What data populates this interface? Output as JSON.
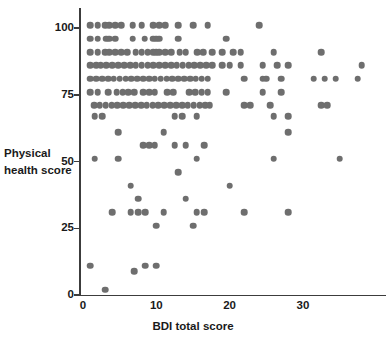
{
  "chart_data": {
    "type": "scatter",
    "title": "",
    "xlabel": "BDI total score",
    "ylabel": "Physical health score",
    "xlim": [
      0,
      42
    ],
    "ylim": [
      0,
      105
    ],
    "grid": false,
    "legend": null,
    "marker_color": "#6e6e6e",
    "axis_color": "#3c3c3c",
    "xticks": [
      {
        "value": 0,
        "label": "0"
      },
      {
        "value": 10,
        "label": "10"
      },
      {
        "value": 20,
        "label": "20"
      },
      {
        "value": 30,
        "label": "30"
      }
    ],
    "yticks": [
      {
        "value": 0,
        "label": "0"
      },
      {
        "value": 25,
        "label": "25"
      },
      {
        "value": 50,
        "label": "50"
      },
      {
        "value": 75,
        "label": "75"
      },
      {
        "value": 100,
        "label": "100"
      }
    ],
    "points": [
      [
        1,
        101
      ],
      [
        2,
        101
      ],
      [
        3,
        101
      ],
      [
        3.6,
        101
      ],
      [
        4.4,
        101
      ],
      [
        5.2,
        101
      ],
      [
        6.8,
        101
      ],
      [
        8,
        101
      ],
      [
        9.6,
        101
      ],
      [
        10.4,
        101
      ],
      [
        11.2,
        101
      ],
      [
        13,
        101
      ],
      [
        15,
        101
      ],
      [
        17,
        101
      ],
      [
        24,
        101
      ],
      [
        1,
        96
      ],
      [
        2,
        96
      ],
      [
        3.2,
        96
      ],
      [
        3.6,
        96
      ],
      [
        4.4,
        96
      ],
      [
        6.8,
        96
      ],
      [
        8.4,
        96
      ],
      [
        9.6,
        96
      ],
      [
        10,
        96
      ],
      [
        10.4,
        96
      ],
      [
        13,
        96
      ],
      [
        19.5,
        96
      ],
      [
        1,
        91
      ],
      [
        2,
        91
      ],
      [
        3,
        91
      ],
      [
        3.6,
        91
      ],
      [
        4.4,
        91
      ],
      [
        5.2,
        91
      ],
      [
        6,
        91
      ],
      [
        7.2,
        91
      ],
      [
        8,
        91
      ],
      [
        8.8,
        91
      ],
      [
        9.6,
        91
      ],
      [
        10,
        91
      ],
      [
        10.4,
        91
      ],
      [
        11.2,
        91
      ],
      [
        12,
        91
      ],
      [
        13.2,
        91
      ],
      [
        14,
        91
      ],
      [
        15.6,
        91
      ],
      [
        16.4,
        91
      ],
      [
        17.6,
        91
      ],
      [
        19,
        91
      ],
      [
        20.5,
        91
      ],
      [
        21.5,
        91
      ],
      [
        26,
        91
      ],
      [
        32.5,
        91
      ],
      [
        1,
        86
      ],
      [
        1.8,
        86
      ],
      [
        2.4,
        86
      ],
      [
        3.2,
        86
      ],
      [
        4,
        86
      ],
      [
        4.8,
        86
      ],
      [
        5.6,
        86
      ],
      [
        6.4,
        86
      ],
      [
        7.2,
        86
      ],
      [
        8,
        86
      ],
      [
        8.8,
        86
      ],
      [
        9.6,
        86
      ],
      [
        10.4,
        86
      ],
      [
        11.2,
        86
      ],
      [
        12,
        86
      ],
      [
        12.8,
        86
      ],
      [
        13.6,
        86
      ],
      [
        14.4,
        86
      ],
      [
        15.2,
        86
      ],
      [
        16,
        86
      ],
      [
        16.8,
        86
      ],
      [
        17.6,
        86
      ],
      [
        19,
        86
      ],
      [
        20,
        86
      ],
      [
        21.5,
        86
      ],
      [
        24.5,
        86
      ],
      [
        26.5,
        86
      ],
      [
        28,
        86
      ],
      [
        38,
        86
      ],
      [
        1,
        81
      ],
      [
        1.8,
        81
      ],
      [
        2.6,
        81
      ],
      [
        3.4,
        81
      ],
      [
        4.2,
        81
      ],
      [
        5,
        81
      ],
      [
        5.8,
        81
      ],
      [
        6.6,
        81
      ],
      [
        7.4,
        81
      ],
      [
        8.2,
        81
      ],
      [
        9,
        81
      ],
      [
        9.8,
        81
      ],
      [
        10.6,
        81
      ],
      [
        11.4,
        81
      ],
      [
        12.2,
        81
      ],
      [
        13,
        81
      ],
      [
        13.8,
        81
      ],
      [
        14.6,
        81
      ],
      [
        15.4,
        81
      ],
      [
        16.2,
        81
      ],
      [
        17,
        81
      ],
      [
        22,
        81
      ],
      [
        24.5,
        81
      ],
      [
        25,
        81
      ],
      [
        27,
        81
      ],
      [
        31.5,
        81
      ],
      [
        33,
        81
      ],
      [
        34.5,
        81
      ],
      [
        37.5,
        81
      ],
      [
        1,
        76
      ],
      [
        2,
        76
      ],
      [
        3.4,
        76
      ],
      [
        4.6,
        76
      ],
      [
        5.4,
        76
      ],
      [
        6.2,
        76
      ],
      [
        7,
        76
      ],
      [
        8.2,
        76
      ],
      [
        9,
        76
      ],
      [
        9.8,
        76
      ],
      [
        11.5,
        76
      ],
      [
        12.3,
        76
      ],
      [
        14.5,
        76
      ],
      [
        15.3,
        76
      ],
      [
        16.2,
        76
      ],
      [
        17,
        76
      ],
      [
        19.5,
        76
      ],
      [
        24.5,
        76
      ],
      [
        27,
        76
      ],
      [
        1.5,
        71
      ],
      [
        2.3,
        71
      ],
      [
        3.1,
        71
      ],
      [
        3.9,
        71
      ],
      [
        4.7,
        71
      ],
      [
        5.5,
        71
      ],
      [
        6.3,
        71
      ],
      [
        7.1,
        71
      ],
      [
        7.9,
        71
      ],
      [
        8.7,
        71
      ],
      [
        9.5,
        71
      ],
      [
        10.3,
        71
      ],
      [
        11.1,
        71
      ],
      [
        11.9,
        71
      ],
      [
        12.7,
        71
      ],
      [
        13.5,
        71
      ],
      [
        14.3,
        71
      ],
      [
        15.1,
        71
      ],
      [
        15.9,
        71
      ],
      [
        16.7,
        71
      ],
      [
        17.3,
        71
      ],
      [
        22,
        71
      ],
      [
        22.8,
        71
      ],
      [
        25.5,
        71
      ],
      [
        32.5,
        71
      ],
      [
        33.3,
        71
      ],
      [
        1.6,
        67
      ],
      [
        2.6,
        67
      ],
      [
        12.5,
        67
      ],
      [
        13.5,
        67
      ],
      [
        15.5,
        67
      ],
      [
        26,
        67
      ],
      [
        28,
        67
      ],
      [
        4.8,
        61
      ],
      [
        11,
        61
      ],
      [
        28,
        61
      ],
      [
        8.2,
        56
      ],
      [
        9,
        56
      ],
      [
        9.8,
        56
      ],
      [
        12.5,
        56
      ],
      [
        14,
        56
      ],
      [
        16.5,
        56
      ],
      [
        1.6,
        51
      ],
      [
        4.8,
        51
      ],
      [
        15.5,
        51
      ],
      [
        26,
        51
      ],
      [
        35,
        51
      ],
      [
        13,
        46
      ],
      [
        6.5,
        41
      ],
      [
        20,
        41
      ],
      [
        7.5,
        36
      ],
      [
        14,
        36
      ],
      [
        4,
        31
      ],
      [
        6.5,
        31
      ],
      [
        7.5,
        31
      ],
      [
        8.5,
        31
      ],
      [
        11,
        31
      ],
      [
        15.5,
        31
      ],
      [
        16.5,
        31
      ],
      [
        22,
        31
      ],
      [
        28,
        31
      ],
      [
        10,
        26
      ],
      [
        15,
        26
      ],
      [
        1,
        11
      ],
      [
        7,
        9
      ],
      [
        8.5,
        11
      ],
      [
        10,
        11
      ],
      [
        3,
        2
      ]
    ]
  }
}
